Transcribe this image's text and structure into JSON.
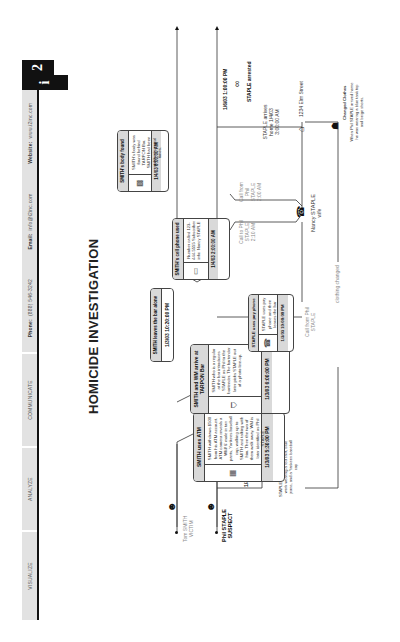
{
  "header": {
    "nav": [
      {
        "label": "VISUALIZE"
      },
      {
        "label": "ANALYZE"
      },
      {
        "label": "COMMUNICATE"
      }
    ],
    "phone_label": "Phone:",
    "phone_value": "(888) 546-3242",
    "email_label": "Email:",
    "email_value": "info@i2inc.com",
    "website_label": "Website:",
    "website_value": "www.i2inc.com",
    "logo_i": "i",
    "logo_2": "2"
  },
  "title": "HOMICIDE INVESTIGATION",
  "people": [
    {
      "name": "Tom SMITH",
      "role": "VICTIM",
      "icon": "person-icon"
    },
    {
      "name": "Phil STAPLE",
      "role": "SUSPECT",
      "icon": "person-icon"
    },
    {
      "name": "Nancy STAPLE",
      "role": "wife",
      "icon": "phone-person-icon"
    }
  ],
  "events": [
    {
      "id": "atm",
      "title": "SMITH uses ATM",
      "body": "SMITH withdraws $500 from his ATM account. ATM camera reveals a WM/ 6' male in tan pants, Yankees baseball cap, walking up to SMITH and talking with him. Then the two of them walk away. WM is later identified as Phil STAPLE",
      "footer": "1/3/03  5:30:00 PM",
      "icon": "atm-icon"
    },
    {
      "id": "tarpon",
      "title": "SMITH and WM arrive at TARPON Bar",
      "body": "SMITH who is a regular at the bar introduces STAPLE as Phil to the bartender. The bartender later picks STAPLE out of a photo line-up.",
      "footer": "1/3/03  6:00:00 PM",
      "icon": "bar-icon"
    },
    {
      "id": "leaves",
      "title": "SMITH leaves the bar alone",
      "footer": "1/3/03  10:20:00 PM"
    },
    {
      "id": "staple_phone",
      "title": "STAPLE uses pay phone",
      "body": "STAPLE uses pay phone and then leaves the bar",
      "footer": "1/3/03  10:00:00 PM",
      "icon": "payphone-icon"
    },
    {
      "id": "cellphone",
      "title": "SMITH's cell phone used",
      "body": "Number called 123-444-5555 Subscriber info: Nancy STAPLE",
      "footer": "1/4/03  2:00:00 AM",
      "icon": "cellphone-icon"
    },
    {
      "id": "body",
      "title": "SMITH's body found",
      "body": "SMITH's body was found behind TARPON Bar. SMITH had been stabbed several times.",
      "footer": "1/4/03  8:00:00 AM",
      "icon": "evidence-icon"
    }
  ],
  "annotations": {
    "suspect_time": "1/3/03 5:25:00 PM",
    "staple_leaves_work": "STAPLE leaves work STAPLE left work wearing a red shirt, blue jeans, and a Yankees baseball cap",
    "clothing_changed": "clothing changed",
    "call_from_phil_1": "Call from Phil STAPLE",
    "call_to_phil": "Call to Phil STAPLE 2:10 AM",
    "call_from_phil_2": "Call from Phil STAPLE 2:00 AM",
    "staple_arrives_home": "STAPLE arrives home 1/4/03  3:00:00 AM",
    "address": "1234 Elm Street",
    "changed_clothes_title": "Changed Clothes",
    "changed_clothes_body": "When Phil STAPLE arrived home he was wearing a blue tank top and beige shorts.",
    "arrest_time": "1/6/03  1:00:00 PM",
    "arrest_label": "STAPLE arrested"
  }
}
